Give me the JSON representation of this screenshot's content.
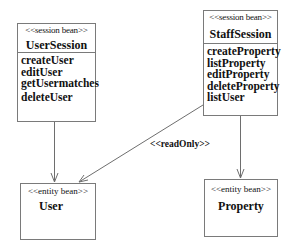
{
  "diagram": {
    "type": "uml-class-diagram",
    "classes": [
      {
        "id": "user_session",
        "stereotype": "<<session bean>>",
        "name": "UserSession",
        "operations": [
          "createUser",
          "editUser",
          "getUsermatches",
          "deleteUser"
        ]
      },
      {
        "id": "staff_session",
        "stereotype": "<<session bean>>",
        "name": "StaffSession",
        "operations": [
          "createProperty",
          "listProperty",
          "editProperty",
          "deleteProperty",
          "listUser"
        ]
      },
      {
        "id": "user",
        "stereotype": "<<entity bean>>",
        "name": "User",
        "operations": []
      },
      {
        "id": "property",
        "stereotype": "<<entity bean>>",
        "name": "Property",
        "operations": []
      }
    ],
    "relationships": [
      {
        "from": "UserSession",
        "to": "User",
        "type": "dependency",
        "label": ""
      },
      {
        "from": "StaffSession",
        "to": "Property",
        "type": "dependency",
        "label": ""
      },
      {
        "from": "StaffSession",
        "to": "User",
        "type": "dependency",
        "label": "<<readOnly>>"
      }
    ],
    "colors": {
      "line": "#6e6e6e",
      "text": "#111111",
      "background": "#ffffff"
    }
  }
}
